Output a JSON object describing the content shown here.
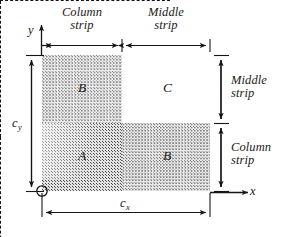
{
  "figure": {
    "type": "engineering-diagram",
    "axes": {
      "x_label": "x",
      "y_label": "y",
      "origin_marker": "origin-circle"
    },
    "dimensions": {
      "width_label": "c",
      "width_subscript": "x",
      "height_label": "c",
      "height_subscript": "y"
    },
    "strips": {
      "top": [
        {
          "line1": "Column",
          "line2": "strip"
        },
        {
          "line1": "Middle",
          "line2": "strip"
        }
      ],
      "right": [
        {
          "line1": "Middle",
          "line2": "strip"
        },
        {
          "line1": "Column",
          "line2": "strip"
        }
      ]
    },
    "regions": [
      {
        "id": "top-left",
        "label": "B",
        "shading": "light-stipple"
      },
      {
        "id": "top-right",
        "label": "C",
        "shading": "none"
      },
      {
        "id": "bottom-left",
        "label": "A",
        "shading": "dark-stipple"
      },
      {
        "id": "bottom-right",
        "label": "B",
        "shading": "medium-stipple"
      }
    ],
    "colors": {
      "ink": "#151515",
      "shade_dark": "#e2e2e2",
      "shade_medium": "#ebebeb",
      "shade_light": "#ededed",
      "background": "#ffffff"
    }
  }
}
